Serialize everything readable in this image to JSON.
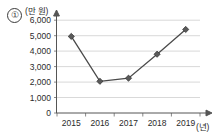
{
  "item": {
    "number": "①"
  },
  "chart_data": {
    "type": "line",
    "title": "",
    "subtitle": "",
    "xlabel": "(년)",
    "ylabel": "(만 원)",
    "categories": [
      "2015",
      "2016",
      "2017",
      "2018",
      "2019"
    ],
    "values": [
      4950,
      2050,
      2250,
      3800,
      5400
    ],
    "series": [
      {
        "name": "",
        "values": [
          4950,
          2050,
          2250,
          3800,
          5400
        ]
      }
    ],
    "ytick_labels": [
      "0",
      "1,000",
      "2,000",
      "3,000",
      "4,000",
      "5,000",
      "6,000"
    ],
    "ytick_values": [
      0,
      1000,
      2000,
      3000,
      4000,
      5000,
      6000
    ],
    "ylim": [
      0,
      6400
    ],
    "xtick_labels": [
      "2015",
      "2016",
      "2017",
      "2018",
      "2019"
    ],
    "grid": true,
    "grid_axis": "y",
    "legend": false,
    "legend_position": "none",
    "marker": "diamond",
    "colors": {
      "line": "#4a4a4a",
      "marker_fill": "#5a5a5a",
      "marker_stroke": "#2f2f2f",
      "gridline": "#c8c8c8",
      "axis": "#555555",
      "text": "#2b2b2b",
      "background": "#ffffff"
    }
  }
}
